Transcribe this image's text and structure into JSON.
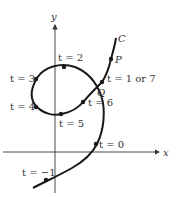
{
  "axes": {
    "x_label": "x",
    "y_label": "y"
  },
  "curve": {
    "name_label": "C",
    "color": "#1a1a1a"
  },
  "points": {
    "P": "P",
    "Q": "Q",
    "t_neg1": "t = −1",
    "t_0": "t = 0",
    "t_1_or_7": "t = 1 or 7",
    "t_2": "t = 2",
    "t_3": "t = 3",
    "t_4": "t = 4",
    "t_5": "t = 5",
    "t_6": "t = 6"
  }
}
